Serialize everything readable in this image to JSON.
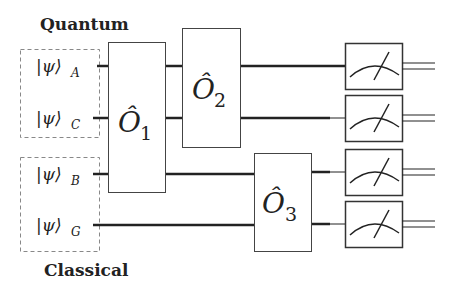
{
  "groups": {
    "quantum": {
      "label": "Quantum"
    },
    "classical": {
      "label": "Classical"
    }
  },
  "inputs": [
    {
      "id": "A",
      "symbol": "|ψ⟩",
      "subscript": "A",
      "group": "quantum"
    },
    {
      "id": "C",
      "symbol": "|ψ⟩",
      "subscript": "C",
      "group": "quantum"
    },
    {
      "id": "B",
      "symbol": "|ψ⟩",
      "subscript": "B",
      "group": "classical"
    },
    {
      "id": "G",
      "symbol": "|ψ⟩",
      "subscript": "G",
      "group": "classical"
    }
  ],
  "operators": [
    {
      "id": "O1",
      "symbol": "Ô",
      "subscript": "1",
      "acts_on": [
        "A",
        "C",
        "B"
      ]
    },
    {
      "id": "O2",
      "symbol": "Ô",
      "subscript": "2",
      "acts_on": [
        "A",
        "C"
      ]
    },
    {
      "id": "O3",
      "symbol": "Ô",
      "subscript": "3",
      "acts_on": [
        "B",
        "G"
      ]
    }
  ],
  "measurements": [
    {
      "wire": "A",
      "icon": "meter-icon"
    },
    {
      "wire": "C",
      "icon": "meter-icon"
    },
    {
      "wire": "B",
      "icon": "meter-icon"
    },
    {
      "wire": "G",
      "icon": "meter-icon"
    }
  ],
  "colors": {
    "stroke": "#222222",
    "dashed_box": "#888888",
    "background": "#ffffff"
  }
}
